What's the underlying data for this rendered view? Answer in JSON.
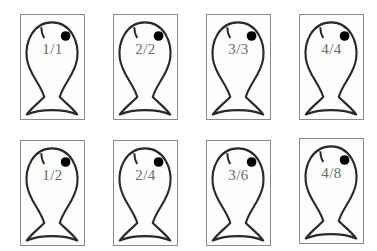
{
  "diagram": {
    "type": "fraction-fish-cards",
    "rows": [
      {
        "cards": [
          {
            "label": "1/1"
          },
          {
            "label": "2/2"
          },
          {
            "label": "3/3"
          },
          {
            "label": "4/4"
          }
        ]
      },
      {
        "cards": [
          {
            "label": "1/2"
          },
          {
            "label": "2/4"
          },
          {
            "label": "3/6"
          },
          {
            "label": "4/8"
          }
        ]
      }
    ],
    "icon": "fish-outline-icon",
    "colors": {
      "outline": "#2a2a2a",
      "eye": "#000000",
      "label": "#6b6b6b",
      "border": "#8a8a8a"
    }
  }
}
